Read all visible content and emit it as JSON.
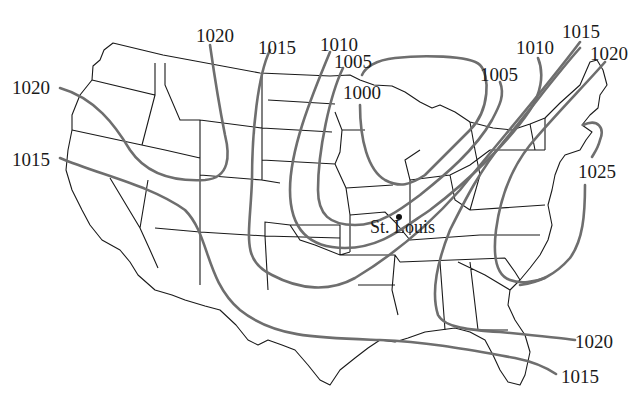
{
  "map": {
    "title": "Surface pressure map (isobars, mb) — contiguous United States",
    "background_color": "#ffffff",
    "isobar_color": "#6e6e6e",
    "border_color": "#1a1a1a",
    "units": "millibars",
    "contour_interval": 5
  },
  "isobar_labels": [
    {
      "id": "w-1020",
      "value": "1020",
      "x": 12,
      "y": 78
    },
    {
      "id": "w-1015",
      "value": "1015",
      "x": 12,
      "y": 150
    },
    {
      "id": "n-1020",
      "value": "1020",
      "x": 196,
      "y": 26
    },
    {
      "id": "n-1015",
      "value": "1015",
      "x": 258,
      "y": 38
    },
    {
      "id": "n-1010",
      "value": "1010",
      "x": 320,
      "y": 35
    },
    {
      "id": "n-1005",
      "value": "1005",
      "x": 334,
      "y": 52
    },
    {
      "id": "low-1000",
      "value": "1000",
      "x": 343,
      "y": 83
    },
    {
      "id": "ne-1005",
      "value": "1005",
      "x": 480,
      "y": 65
    },
    {
      "id": "ne-1010",
      "value": "1010",
      "x": 516,
      "y": 38
    },
    {
      "id": "ne-1015",
      "value": "1015",
      "x": 562,
      "y": 22
    },
    {
      "id": "ne-1020",
      "value": "1020",
      "x": 590,
      "y": 44
    },
    {
      "id": "e-1025",
      "value": "1025",
      "x": 578,
      "y": 162
    },
    {
      "id": "se-1020",
      "value": "1020",
      "x": 575,
      "y": 332
    },
    {
      "id": "se-1015",
      "value": "1015",
      "x": 561,
      "y": 367
    }
  ],
  "cities": [
    {
      "name": "St. Louis",
      "dot_x": 396,
      "dot_y": 214,
      "label_x": 370,
      "label_y": 218
    }
  ]
}
